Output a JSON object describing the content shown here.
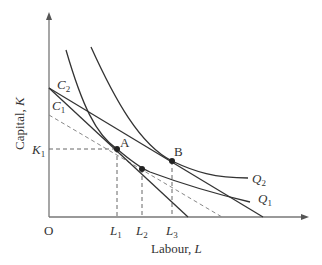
{
  "diagram": {
    "type": "isoquant-isocost",
    "axes": {
      "x_label": "Labour, ",
      "x_label_var": "L",
      "y_label": "Capital, ",
      "y_label_var": "K",
      "origin_label": "O"
    },
    "ticks": {
      "x": [
        {
          "var": "L",
          "sub": "1"
        },
        {
          "var": "L",
          "sub": "2"
        },
        {
          "var": "L",
          "sub": "3"
        }
      ],
      "y": [
        {
          "var": "K",
          "sub": "1"
        }
      ]
    },
    "isocost_labels": [
      {
        "var": "C",
        "sub": "2"
      },
      {
        "var": "C",
        "sub": "1"
      }
    ],
    "isoquant_labels": [
      {
        "var": "Q",
        "sub": "2"
      },
      {
        "var": "Q",
        "sub": "1"
      }
    ],
    "points": [
      {
        "label": "A"
      },
      {
        "label": "B"
      }
    ],
    "colors": {
      "line": "#333333",
      "axis": "#777777",
      "dashed": "#666666",
      "background": "#ffffff"
    }
  }
}
